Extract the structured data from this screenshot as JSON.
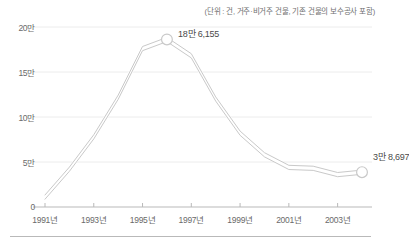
{
  "chart_data": {
    "type": "line",
    "title": "",
    "subtitle": "",
    "unit_note": "(단위 : 건, 거주·비거주 건물, 기존 건물의 보수공사 포함)",
    "xlabel": "",
    "ylabel": "",
    "x": [
      1991,
      1992,
      1993,
      1994,
      1995,
      1996,
      1997,
      1998,
      1999,
      2000,
      2001,
      2002,
      2003,
      2004
    ],
    "x_tick_labels": [
      "1991년",
      "1993년",
      "1995년",
      "1997년",
      "1999년",
      "2001년",
      "2003년"
    ],
    "x_tick_values": [
      1991,
      1993,
      1995,
      1997,
      1999,
      2001,
      2003
    ],
    "xlim": [
      1991,
      2004
    ],
    "series": [
      {
        "name": "건축 허가 건수",
        "values": [
          11000,
          42000,
          78000,
          122000,
          176000,
          186155,
          168000,
          120000,
          82000,
          58000,
          44000,
          43000,
          36000,
          38697
        ]
      }
    ],
    "y_tick_labels": [
      "20만",
      "15만",
      "10만",
      "5만",
      "0"
    ],
    "y_tick_values": [
      200000,
      150000,
      100000,
      50000,
      0
    ],
    "ylim": [
      0,
      200000
    ],
    "grid": "horizontal",
    "legend": "none",
    "line_color": "#c9c9c9",
    "annotations": [
      {
        "label": "18만 6,155",
        "x": 1996,
        "y": 186155,
        "marker": "circle"
      },
      {
        "label": "3만 8,697",
        "x": 2004,
        "y": 38697,
        "marker": "circle"
      }
    ]
  },
  "colors": {
    "grid": "#ececec",
    "axis": "#b9b9b9",
    "line": "#c9c9c9",
    "text": "#6a6a6a",
    "annotation_text": "#4a4a4a"
  }
}
